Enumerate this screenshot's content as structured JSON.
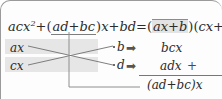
{
  "figure": {
    "kind": "cross-multiplication-factoring-diagram",
    "identity": {
      "left_prefix": "acx",
      "left_exponent": "2",
      "left_plus_1": "+",
      "middle_group_open": "(",
      "middle_group": "ad+bc",
      "middle_group_close": ")",
      "middle_var": "x",
      "left_plus_2": "+",
      "left_const": "bd",
      "equals": "=",
      "factor1_open": "(",
      "factor1": "ax+b",
      "factor1_close": ")",
      "factor2_open": "(",
      "factor2": "cx+d",
      "factor2_close": ")"
    },
    "grid": {
      "left_top": "ax",
      "left_bottom": "cx",
      "right_top": "b",
      "right_bottom": "d",
      "arrow_glyph": "➡"
    },
    "products": {
      "top": "bcx",
      "bottom": "adx",
      "plus": "+",
      "sum": "(ad+bc)x"
    },
    "colors": {
      "highlight_band": "#e6e6e6",
      "factor_box": "#e3e3e3",
      "rule": "#777777",
      "text": "#2b2b2b",
      "connector": "#8e8e8e",
      "cross_line": "#707070"
    }
  }
}
